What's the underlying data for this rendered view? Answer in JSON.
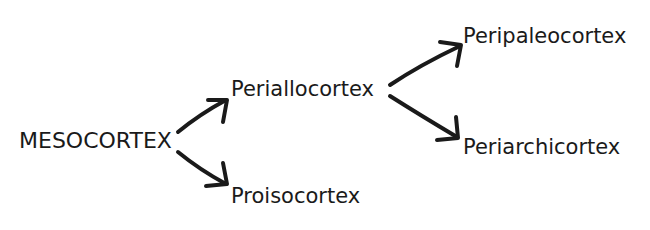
{
  "diagram": {
    "type": "tree",
    "colors": {
      "text": "#1a1a1a",
      "arrow": "#1a1a1a",
      "background": "#ffffff"
    },
    "nodes": {
      "root": "MESOCORTEX",
      "periallocortex": "Periallocortex",
      "proisocortex": "Proisocortex",
      "peripaleocortex": "Peripaleocortex",
      "periarchicortex": "Periarchicortex"
    },
    "edges": [
      {
        "from": "MESOCORTEX",
        "to": "Periallocortex"
      },
      {
        "from": "MESOCORTEX",
        "to": "Proisocortex"
      },
      {
        "from": "Periallocortex",
        "to": "Peripaleocortex"
      },
      {
        "from": "Periallocortex",
        "to": "Periarchicortex"
      }
    ]
  }
}
